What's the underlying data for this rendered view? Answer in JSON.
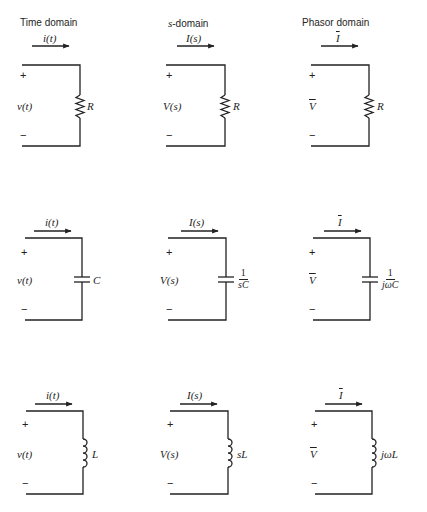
{
  "headers": {
    "time": "Time domain",
    "s_prefix": "s",
    "s_suffix": "-domain",
    "phasor": "Phasor domain"
  },
  "rows": [
    {
      "component": "resistor",
      "time": {
        "current": "i(t)",
        "voltage": "v(t)",
        "impedance": "R"
      },
      "s": {
        "current": "I(s)",
        "voltage": "V(s)",
        "impedance": "R"
      },
      "phasor": {
        "current": "I",
        "voltage": "V",
        "impedance": "R"
      }
    },
    {
      "component": "capacitor",
      "time": {
        "current": "i(t)",
        "voltage": "v(t)",
        "impedance": "C"
      },
      "s": {
        "current": "I(s)",
        "voltage": "V(s)",
        "impedance_num": "1",
        "impedance_den": "sC"
      },
      "phasor": {
        "current": "I",
        "voltage": "V",
        "impedance_num": "1",
        "impedance_den": "jωC"
      }
    },
    {
      "component": "inductor",
      "time": {
        "current": "i(t)",
        "voltage": "v(t)",
        "impedance": "L"
      },
      "s": {
        "current": "I(s)",
        "voltage": "V(s)",
        "impedance": "sL"
      },
      "phasor": {
        "current": "I",
        "voltage": "V",
        "impedance": "jωL"
      }
    }
  ],
  "signs": {
    "plus": "+",
    "minus": "−"
  }
}
